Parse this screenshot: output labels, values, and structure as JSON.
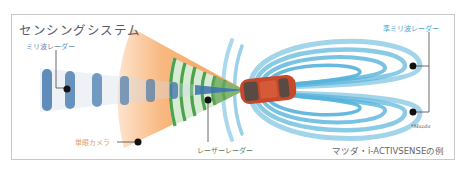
{
  "title": "センシングシステム",
  "labels": {
    "millimeter_wave_radar": "ミリ波レーダー",
    "quasi_millimeter_wave_radar": "準ミリ波レーダー",
    "monocular_camera": "単眼カメラ",
    "laser_radar": "レーザーレーダー"
  },
  "credit": "*Mazda",
  "caption": "マツダ・i-ACTIVSENSEの例",
  "colors": {
    "title": "#5a5a6e",
    "mmw_label": "#6a8bb3",
    "nmmw_label": "#4aa3d0",
    "camera_label": "#e8a06a",
    "camera_cone": "#f6a35a",
    "laser_cone": "#3f9a3f",
    "mmw_beam": "#2f6aa5",
    "nmmw_wave": "#3aa6d4",
    "car_body": "#c8482a",
    "frame_border": "#c9c9c9"
  }
}
